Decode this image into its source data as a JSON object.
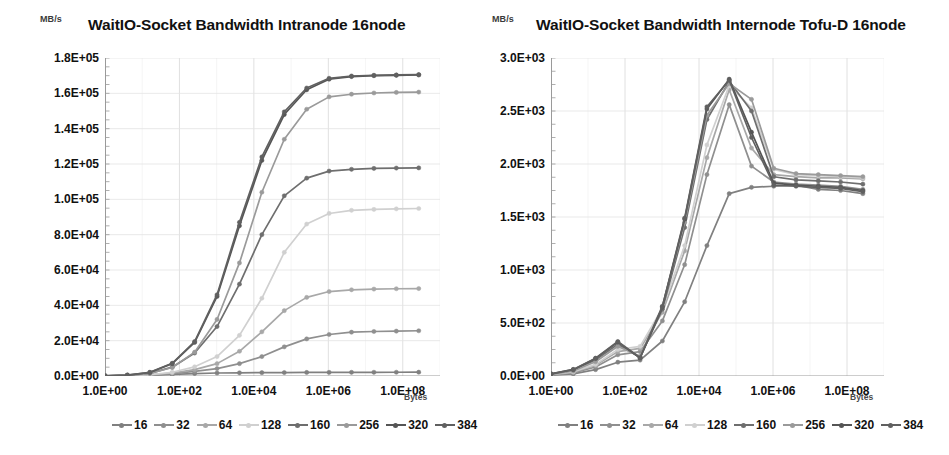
{
  "panels": [
    {
      "unit": "MB/s",
      "title": "WaitIO-Socket Bandwidth Intranode 16node",
      "xaxis_label": "Bytes"
    },
    {
      "unit": "MB/s",
      "title": "WaitIO-Socket Bandwidth Internode   Tofu-D 16node",
      "xaxis_label": "Bytes"
    }
  ],
  "legend": [
    {
      "label": "16",
      "color": "#808080"
    },
    {
      "label": "32",
      "color": "#8f8f8f"
    },
    {
      "label": "64",
      "color": "#a8a8a8"
    },
    {
      "label": "128",
      "color": "#d0d0d0"
    },
    {
      "label": "160",
      "color": "#6e6e6e"
    },
    {
      "label": "256",
      "color": "#9a9a9a"
    },
    {
      "label": "320",
      "color": "#555555"
    },
    {
      "label": "384",
      "color": "#606060"
    }
  ],
  "chart_data": [
    {
      "type": "line",
      "title": "WaitIO-Socket Bandwidth Intranode 16node",
      "xlabel": "Bytes",
      "ylabel": "MB/s",
      "xscale": "log",
      "xlim": [
        1,
        1000000000
      ],
      "ylim": [
        0,
        180000
      ],
      "yticks": [
        "0.0E+00",
        "2.0E+04",
        "4.0E+04",
        "6.0E+04",
        "8.0E+04",
        "1.0E+05",
        "1.2E+05",
        "1.4E+05",
        "1.6E+05",
        "1.8E+05"
      ],
      "ytick_values": [
        0,
        20000,
        40000,
        60000,
        80000,
        100000,
        120000,
        140000,
        160000,
        180000
      ],
      "xticks": [
        "1.0E+00",
        "1.0E+02",
        "1.0E+04",
        "1.0E+06",
        "1.0E+08"
      ],
      "xtick_values": [
        1,
        100,
        10000,
        1000000,
        100000000
      ],
      "grid": true,
      "legend_position": "bottom",
      "x": [
        1,
        4,
        16,
        64,
        256,
        1024,
        4096,
        16384,
        65536,
        262144,
        1048576,
        4194304,
        16777216,
        67108864,
        268435456
      ],
      "series": [
        {
          "name": "16",
          "color": "#808080",
          "values": [
            60,
            120,
            400,
            900,
            1400,
            1700,
            1800,
            1900,
            1950,
            2000,
            2050,
            2080,
            2100,
            2120,
            2150
          ]
        },
        {
          "name": "32",
          "color": "#8f8f8f",
          "values": [
            60,
            150,
            500,
            1300,
            2600,
            4200,
            7000,
            11000,
            16500,
            21000,
            23500,
            24800,
            25200,
            25400,
            25600
          ]
        },
        {
          "name": "64",
          "color": "#a8a8a8",
          "values": [
            70,
            180,
            600,
            1700,
            3600,
            7000,
            14000,
            25000,
            37000,
            44500,
            47800,
            48800,
            49200,
            49400,
            49500
          ]
        },
        {
          "name": "128",
          "color": "#d0d0d0",
          "values": [
            70,
            200,
            700,
            2100,
            5200,
            11000,
            23000,
            44000,
            70000,
            86000,
            92000,
            93800,
            94300,
            94600,
            94800
          ]
        },
        {
          "name": "160",
          "color": "#6e6e6e",
          "values": [
            120,
            400,
            1500,
            5000,
            13000,
            28000,
            52000,
            80000,
            102000,
            112000,
            116000,
            117000,
            117500,
            117700,
            117800
          ]
        },
        {
          "name": "256",
          "color": "#9a9a9a",
          "values": [
            110,
            380,
            1400,
            4800,
            13500,
            32000,
            64000,
            104000,
            134000,
            151000,
            158000,
            159500,
            160200,
            160500,
            160700
          ]
        },
        {
          "name": "320",
          "color": "#555555",
          "values": [
            150,
            520,
            2000,
            7000,
            19000,
            45000,
            85000,
            122000,
            148000,
            162000,
            168000,
            169500,
            170000,
            170200,
            170400
          ]
        },
        {
          "name": "384",
          "color": "#606060",
          "values": [
            150,
            540,
            2100,
            7200,
            19500,
            46000,
            87000,
            124000,
            149500,
            163000,
            168500,
            169800,
            170200,
            170400,
            170600
          ]
        }
      ]
    },
    {
      "type": "line",
      "title": "WaitIO-Socket Bandwidth Internode   Tofu-D 16node",
      "xlabel": "Bytes",
      "ylabel": "MB/s",
      "xscale": "log",
      "xlim": [
        1,
        1000000000
      ],
      "ylim": [
        0,
        3000
      ],
      "yticks": [
        "0.0E+00",
        "5.0E+02",
        "1.0E+03",
        "1.5E+03",
        "2.0E+03",
        "2.5E+03",
        "3.0E+03"
      ],
      "ytick_values": [
        0,
        500,
        1000,
        1500,
        2000,
        2500,
        3000
      ],
      "xticks": [
        "1.0E+00",
        "1.0E+02",
        "1.0E+04",
        "1.0E+06",
        "1.0E+08"
      ],
      "xtick_values": [
        1,
        100,
        10000,
        1000000,
        100000000
      ],
      "grid": true,
      "legend_position": "bottom",
      "x": [
        1,
        4,
        16,
        64,
        256,
        1024,
        4096,
        16384,
        65536,
        262144,
        1048576,
        4194304,
        16777216,
        67108864,
        268435456
      ],
      "series": [
        {
          "name": "16",
          "color": "#808080",
          "values": [
            8,
            20,
            60,
            130,
            150,
            330,
            700,
            1230,
            1720,
            1780,
            1790,
            1800,
            1760,
            1750,
            1720
          ]
        },
        {
          "name": "32",
          "color": "#8f8f8f",
          "values": [
            10,
            30,
            85,
            200,
            230,
            520,
            1050,
            1900,
            2560,
            1980,
            1830,
            1810,
            1800,
            1790,
            1760
          ]
        },
        {
          "name": "64",
          "color": "#a8a8a8",
          "values": [
            12,
            35,
            100,
            230,
            260,
            600,
            1180,
            2060,
            2700,
            2150,
            1900,
            1880,
            1870,
            1870,
            1860
          ]
        },
        {
          "name": "128",
          "color": "#d0d0d0",
          "values": [
            14,
            40,
            110,
            250,
            280,
            640,
            1230,
            2180,
            2740,
            2530,
            1950,
            1900,
            1890,
            1880,
            1870
          ]
        },
        {
          "name": "160",
          "color": "#6e6e6e",
          "values": [
            18,
            55,
            150,
            300,
            175,
            630,
            1400,
            2420,
            2780,
            2500,
            1880,
            1850,
            1840,
            1830,
            1810
          ]
        },
        {
          "name": "256",
          "color": "#9a9a9a",
          "values": [
            16,
            48,
            135,
            280,
            185,
            660,
            1450,
            2460,
            2760,
            2610,
            1960,
            1910,
            1900,
            1890,
            1880
          ]
        },
        {
          "name": "320",
          "color": "#555555",
          "values": [
            20,
            60,
            165,
            320,
            170,
            650,
            1480,
            2520,
            2800,
            2300,
            1820,
            1800,
            1790,
            1780,
            1750
          ]
        },
        {
          "name": "384",
          "color": "#606060",
          "values": [
            20,
            62,
            168,
            325,
            172,
            655,
            1490,
            2540,
            2790,
            2250,
            1800,
            1790,
            1780,
            1770,
            1740
          ]
        }
      ]
    }
  ]
}
